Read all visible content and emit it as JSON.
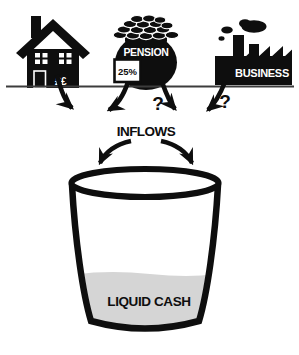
{
  "diagram": {
    "background": "#ffffff",
    "ink_color": "#0e0e0e",
    "liquid_color": "#d5d5d5",
    "ground_line_color": "#3c3c3c",
    "sources": [
      {
        "name": "home",
        "icon": "house-icon",
        "text": "££"
      },
      {
        "name": "pension",
        "icon": "pension-pot-icon",
        "text": "PENSION",
        "badge": "25%"
      },
      {
        "name": "business",
        "icon": "factory-icon",
        "text": "BUSINESS"
      }
    ],
    "unknown_flow_marks": [
      "?",
      "?"
    ],
    "inflows_label": "INFLOWS",
    "bucket": {
      "label": "LIQUID CASH",
      "fill_level": "about one-third full"
    }
  }
}
